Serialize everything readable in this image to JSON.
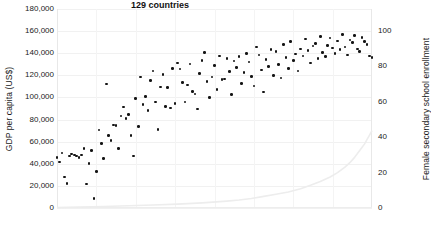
{
  "chart_data": {
    "type": "scatter",
    "title": "",
    "xlabel": "129 countries",
    "grid": true,
    "legend": "none",
    "axes": {
      "left": {
        "label": "GDP per capita (US$)",
        "ticks": [
          "0",
          "20,000",
          "40,000",
          "60,000",
          "80,000",
          "100,000",
          "120,000",
          "140,000",
          "160,000",
          "180,000"
        ],
        "tick_values": [
          0,
          20000,
          40000,
          60000,
          80000,
          100000,
          120000,
          140000,
          160000,
          180000
        ],
        "range": [
          0,
          180000
        ]
      },
      "right": {
        "label": "Female secondary school enrollment",
        "ticks": [
          "0",
          "20",
          "40",
          "60",
          "80",
          "100"
        ],
        "tick_values": [
          0,
          20,
          40,
          60,
          80,
          100
        ],
        "range": [
          0,
          112.5
        ]
      },
      "x": {
        "label": "129 countries",
        "range": [
          1,
          129
        ],
        "ticks": []
      }
    },
    "series": [
      {
        "name": "Female secondary school enrollment",
        "axis": "right",
        "marker": "dot",
        "color": "#141414",
        "x": [
          1,
          2,
          3,
          4,
          5,
          6,
          7,
          8,
          9,
          10,
          11,
          12,
          13,
          14,
          15,
          16,
          17,
          18,
          19,
          20,
          21,
          22,
          23,
          24,
          25,
          26,
          27,
          28,
          29,
          30,
          31,
          32,
          33,
          34,
          35,
          36,
          37,
          38,
          39,
          40,
          41,
          42,
          43,
          44,
          45,
          46,
          47,
          48,
          49,
          50,
          51,
          52,
          53,
          54,
          55,
          56,
          57,
          58,
          59,
          60,
          61,
          62,
          63,
          64,
          65,
          66,
          67,
          68,
          69,
          70,
          71,
          72,
          73,
          74,
          75,
          76,
          77,
          78,
          79,
          80,
          81,
          82,
          83,
          84,
          85,
          86,
          87,
          88,
          89,
          90,
          91,
          92,
          93,
          94,
          95,
          96,
          97,
          98,
          99,
          100,
          101,
          102,
          103,
          104,
          105,
          106,
          107,
          108,
          109,
          110,
          111,
          112,
          113,
          114,
          115,
          116,
          117,
          118,
          119,
          120,
          121,
          122,
          123,
          124,
          125,
          126,
          127,
          128,
          129
        ],
        "values": [
          28.5,
          26.0,
          31.0,
          17.5,
          14.0,
          29.5,
          30.5,
          30.0,
          29.5,
          28.5,
          30.0,
          33.5,
          13.5,
          25.0,
          32.5,
          5.5,
          20.5,
          44.0,
          36.5,
          28.0,
          70.0,
          41.0,
          38.0,
          47.0,
          46.5,
          33.5,
          52.0,
          57.0,
          50.5,
          53.0,
          41.0,
          29.5,
          62.0,
          46.0,
          74.0,
          58.5,
          63.0,
          55.0,
          72.0,
          77.5,
          60.0,
          44.5,
          68.5,
          75.5,
          57.5,
          68.0,
          56.5,
          79.0,
          59.0,
          82.0,
          78.5,
          71.0,
          60.0,
          69.5,
          81.5,
          66.0,
          64.5,
          56.0,
          76.0,
          83.5,
          88.0,
          71.5,
          62.5,
          74.0,
          80.5,
          67.0,
          86.0,
          72.5,
          73.0,
          84.5,
          77.0,
          64.0,
          83.0,
          79.5,
          85.5,
          70.5,
          76.5,
          87.5,
          82.5,
          74.5,
          69.0,
          91.0,
          86.5,
          78.0,
          65.5,
          84.0,
          80.0,
          89.5,
          75.0,
          88.5,
          81.0,
          73.5,
          92.5,
          85.0,
          79.0,
          94.0,
          83.5,
          87.0,
          77.5,
          90.0,
          86.0,
          95.5,
          89.0,
          82.0,
          91.5,
          93.0,
          84.5,
          97.0,
          88.0,
          85.5,
          92.0,
          96.0,
          90.5,
          87.5,
          94.5,
          89.5,
          98.0,
          91.0,
          86.5,
          95.0,
          93.5,
          97.5,
          90.0,
          88.5,
          96.5,
          94.0,
          92.5,
          86.0,
          85.0
        ]
      },
      {
        "name": "GDP per capita (US$)",
        "axis": "left",
        "marker": "line",
        "color": "#ededed",
        "x": [
          1,
          10,
          20,
          30,
          40,
          50,
          60,
          70,
          75,
          80,
          85,
          90,
          95,
          100,
          104,
          108,
          112,
          115,
          118,
          120,
          122,
          124,
          126,
          127,
          128,
          129
        ],
        "values": [
          500,
          900,
          1400,
          2000,
          2700,
          3500,
          4600,
          6200,
          7200,
          8600,
          10500,
          12500,
          14500,
          17500,
          20500,
          24000,
          28000,
          32000,
          37000,
          41000,
          46000,
          52000,
          58000,
          62000,
          66000,
          70000
        ]
      }
    ]
  }
}
